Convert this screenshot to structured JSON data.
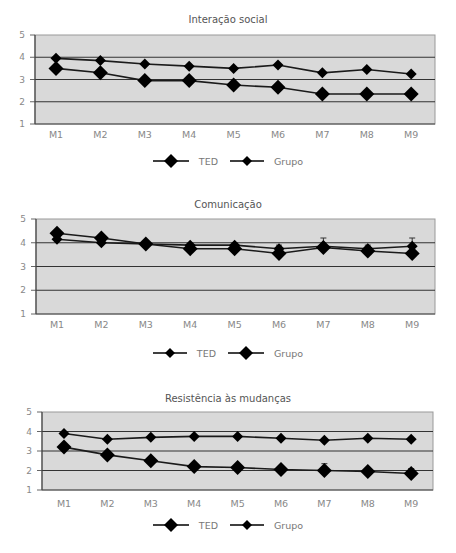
{
  "chart_data": [
    {
      "type": "line",
      "title": "Interação social",
      "categories": [
        "M1",
        "M2",
        "M3",
        "M4",
        "M5",
        "M6",
        "M7",
        "M8",
        "M9"
      ],
      "ylim": [
        1,
        5
      ],
      "yticks": [
        1,
        2,
        3,
        4,
        5
      ],
      "grid": true,
      "legend_position": "bottom",
      "series": [
        {
          "name": "TED",
          "marker": "large-diamond",
          "values": [
            3.5,
            3.3,
            2.95,
            2.95,
            2.75,
            2.65,
            2.35,
            2.35,
            2.35
          ]
        },
        {
          "name": "Grupo",
          "marker": "small-diamond",
          "values": [
            3.95,
            3.85,
            3.7,
            3.6,
            3.5,
            3.65,
            3.3,
            3.45,
            3.25
          ]
        }
      ]
    },
    {
      "type": "line",
      "title": "Comunicação",
      "categories": [
        "M1",
        "M2",
        "M3",
        "M4",
        "M5",
        "M6",
        "M7",
        "M8",
        "M9"
      ],
      "ylim": [
        1,
        5
      ],
      "yticks": [
        1,
        2,
        3,
        4,
        5
      ],
      "grid": true,
      "legend_position": "bottom",
      "error_bars": true,
      "series": [
        {
          "name": "TED",
          "marker": "small-diamond",
          "values": [
            4.15,
            4.0,
            3.95,
            3.9,
            3.9,
            3.75,
            3.85,
            3.75,
            3.85
          ],
          "errors": [
            0,
            0,
            0.05,
            0.05,
            0.1,
            0.15,
            0.35,
            0.15,
            0.35
          ]
        },
        {
          "name": "Grupo",
          "marker": "large-diamond",
          "values": [
            4.4,
            4.2,
            3.95,
            3.75,
            3.75,
            3.55,
            3.8,
            3.65,
            3.55
          ]
        }
      ]
    },
    {
      "type": "line",
      "title": "Resistência às mudanças",
      "categories": [
        "M1",
        "M2",
        "M3",
        "M4",
        "M5",
        "M6",
        "M7",
        "M8",
        "M9"
      ],
      "ylim": [
        1,
        5
      ],
      "yticks": [
        1,
        2,
        3,
        4,
        5
      ],
      "grid": true,
      "legend_position": "bottom",
      "error_bars": true,
      "series": [
        {
          "name": "TED",
          "marker": "large-diamond",
          "values": [
            3.2,
            2.8,
            2.5,
            2.2,
            2.15,
            2.05,
            2.0,
            1.95,
            1.85
          ],
          "errors": [
            0,
            0,
            0,
            0,
            0,
            0,
            0.35,
            0.15,
            0.25
          ]
        },
        {
          "name": "Grupo",
          "marker": "small-diamond",
          "values": [
            3.9,
            3.6,
            3.7,
            3.75,
            3.75,
            3.65,
            3.55,
            3.65,
            3.6
          ]
        }
      ]
    }
  ],
  "colors": {
    "plot_background": "#d9d9d9",
    "grid_line": "#333333",
    "series_line": "#1a1a1a",
    "marker": "#000000",
    "axis_text": "#888888"
  }
}
